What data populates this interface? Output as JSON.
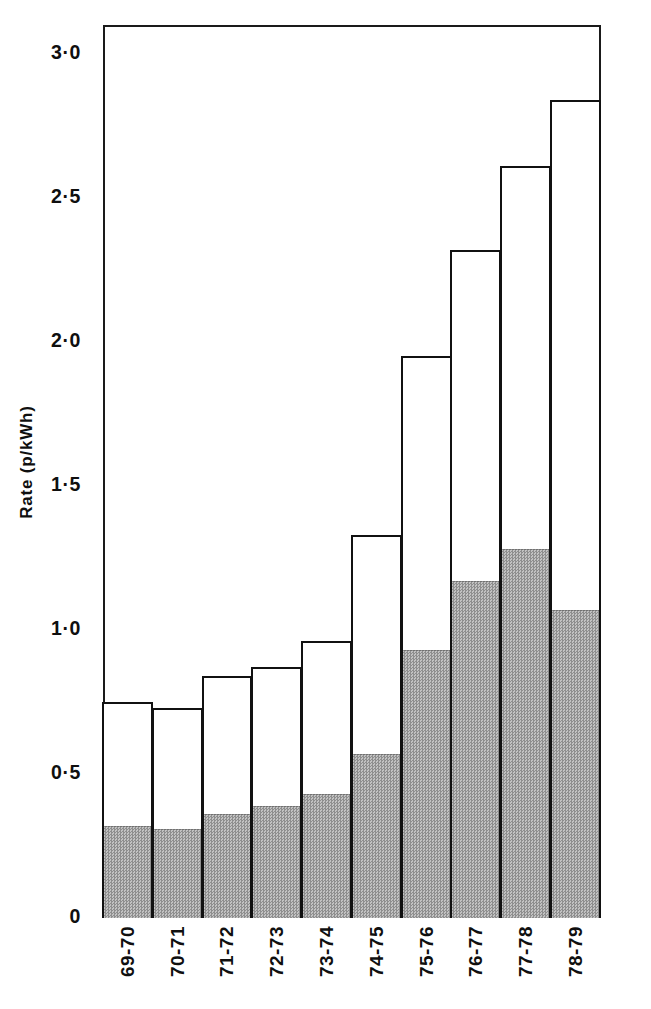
{
  "chart_data": {
    "type": "bar",
    "title": "",
    "subtitle": "",
    "xlabel": "",
    "ylabel": "Rate (p/kWh)",
    "categories": [
      "69-70",
      "70-71",
      "71-72",
      "72-73",
      "73-74",
      "74-75",
      "75-76",
      "76-77",
      "77-78",
      "78-79"
    ],
    "series": [
      {
        "name": "lower-shaded-component",
        "values": [
          0.32,
          0.31,
          0.36,
          0.39,
          0.43,
          0.57,
          0.93,
          1.17,
          1.28,
          1.07
        ]
      },
      {
        "name": "total",
        "values": [
          0.75,
          0.73,
          0.84,
          0.87,
          0.96,
          1.33,
          1.95,
          2.32,
          2.61,
          2.84
        ]
      }
    ],
    "ylim": [
      0,
      3.1
    ],
    "yticks": [
      0,
      0.5,
      1.0,
      1.5,
      2.0,
      2.5,
      3.0
    ],
    "ytick_labels": [
      "0",
      "0·5",
      "1·0",
      "1·5",
      "2·0",
      "2·5",
      "3·0"
    ],
    "grid": false,
    "legend": "none",
    "stacked": true,
    "bar_gap": 0,
    "colors": {
      "outline": "#111111",
      "upper_fill": "#ffffff",
      "lower_fill": "#9d9d9d",
      "background": "#ffffff",
      "text": "#0f0f0f"
    }
  },
  "axis": {
    "y_title": "Rate (p/kWh)"
  }
}
